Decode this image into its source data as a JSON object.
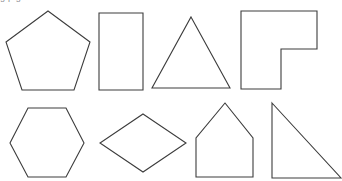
{
  "figure": {
    "clipped_caption_text": "g  p             g",
    "background_color": "#ffffff",
    "stroke_color": "#3c3c3c",
    "fill_color": "#ffffff",
    "stroke_width": 1.1,
    "width": 342,
    "height": 181,
    "rows": 2,
    "columns": 4
  },
  "shapes": [
    {
      "index": 1,
      "name": "pentagon",
      "label": "Regular pentagon",
      "row": 1,
      "column": 1,
      "sides": 5,
      "points": "48,11 90,42 74,90 22,90 6,42"
    },
    {
      "index": 2,
      "name": "rectangle",
      "label": "Rectangle",
      "row": 1,
      "column": 2,
      "sides": 4,
      "points": "99,13 143,13 143,90 99,90"
    },
    {
      "index": 3,
      "name": "triangle",
      "label": "Isosceles triangle",
      "row": 1,
      "column": 3,
      "sides": 3,
      "points": "191,17 230,88 152,88"
    },
    {
      "index": 4,
      "name": "l-shape",
      "label": "L-shaped hexagon",
      "row": 1,
      "column": 4,
      "sides": 6,
      "points": "241,11 317,11 317,49 281,49 281,89 241,89"
    },
    {
      "index": 5,
      "name": "hexagon",
      "label": "Regular hexagon",
      "row": 2,
      "column": 1,
      "sides": 6,
      "points": "28,108 66,108 84,143 66,177 28,177 10,143"
    },
    {
      "index": 6,
      "name": "rhombus",
      "label": "Rhombus",
      "row": 2,
      "column": 2,
      "sides": 4,
      "points": "143,114 186,143 143,172 100,143"
    },
    {
      "index": 7,
      "name": "house-pentagon",
      "label": "House-shaped pentagon",
      "row": 2,
      "column": 3,
      "sides": 5,
      "points": "225,103 253,138 253,177 196,177 196,138"
    },
    {
      "index": 8,
      "name": "right-triangle",
      "label": "Right triangle",
      "row": 2,
      "column": 4,
      "sides": 3,
      "points": "272,103 341,178 272,178"
    }
  ]
}
